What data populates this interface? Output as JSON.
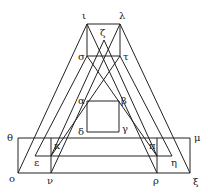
{
  "diagram": {
    "type": "geometric-figure",
    "stroke_color": "#222222",
    "background": "#ffffff",
    "points": {
      "iota": {
        "label": "ι",
        "x": 87,
        "y": 24
      },
      "lambda": {
        "label": "λ",
        "x": 120,
        "y": 24
      },
      "sigma": {
        "label": "σ",
        "x": 87,
        "y": 56
      },
      "tau": {
        "label": "τ",
        "x": 120,
        "y": 56
      },
      "zeta": {
        "label": "ζ",
        "x": 104,
        "y": 40
      },
      "alpha": {
        "label": "α",
        "x": 87,
        "y": 101
      },
      "beta": {
        "label": "β",
        "x": 119,
        "y": 101
      },
      "gamma": {
        "label": "γ",
        "x": 119,
        "y": 132
      },
      "delta": {
        "label": "δ",
        "x": 87,
        "y": 132
      },
      "theta": {
        "label": "θ",
        "x": 18,
        "y": 138
      },
      "mu": {
        "label": "μ",
        "x": 190,
        "y": 138
      },
      "kappa": {
        "label": "κ",
        "x": 51,
        "y": 138
      },
      "pi": {
        "label": "π",
        "x": 157,
        "y": 138
      },
      "epsilon": {
        "label": "ε",
        "x": 35,
        "y": 156
      },
      "eta": {
        "label": "η",
        "x": 172,
        "y": 156
      },
      "omicron": {
        "label": "ο",
        "x": 18,
        "y": 173
      },
      "nu": {
        "label": "ν",
        "x": 51,
        "y": 173
      },
      "rho": {
        "label": "ρ",
        "x": 157,
        "y": 173
      },
      "xi": {
        "label": "ξ",
        "x": 190,
        "y": 173
      }
    },
    "labels": {
      "iota": "ι",
      "lambda": "λ",
      "sigma": "σ",
      "tau": "τ",
      "zeta": "ζ",
      "alpha": "α",
      "beta": "β",
      "gamma": "γ",
      "delta": "δ",
      "theta": "θ",
      "mu": "μ",
      "kappa": "κ",
      "pi": "π",
      "epsilon": "ε",
      "eta": "η",
      "omicron": "ο",
      "nu": "ν",
      "rho": "ρ",
      "xi": "ξ"
    }
  }
}
